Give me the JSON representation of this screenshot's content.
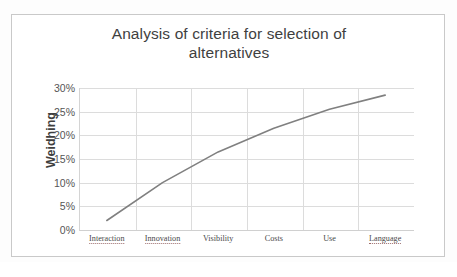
{
  "chart_data": {
    "type": "line",
    "title": "Analysis of criteria for selection of alternatives",
    "title_line1": "Analysis of criteria for selection of",
    "title_line2": "alternatives",
    "xlabel": "",
    "ylabel": "Weidhing",
    "categories": [
      "Interaction",
      "Innovation",
      "Visibility",
      "Costs",
      "Use",
      "Language"
    ],
    "values": [
      0.02,
      0.1,
      0.165,
      0.215,
      0.255,
      0.285
    ],
    "value_labels": [
      "2%",
      "10%",
      "16.5%",
      "21.5%",
      "25.5%",
      "28.5%"
    ],
    "ylim": [
      0,
      0.3
    ],
    "ytick_values": [
      0,
      0.05,
      0.1,
      0.15,
      0.2,
      0.25,
      0.3
    ],
    "ytick_labels": [
      "0%",
      "5%",
      "10%",
      "15%",
      "20%",
      "25%",
      "30%"
    ],
    "grid": "horizontal-and-vertical",
    "legend": "none",
    "series": [
      {
        "name": "Weidhing",
        "color": "#808080",
        "values": [
          0.02,
          0.1,
          0.165,
          0.215,
          0.255,
          0.285
        ]
      }
    ]
  },
  "colors": {
    "line": "#808080",
    "gridline": "#dcdcdc",
    "axis": "#d0d0d0",
    "chart_border": "#c9c9c9",
    "title_text": "#3f3f3f",
    "tick_text": "#555555",
    "background": "#ffffff"
  }
}
